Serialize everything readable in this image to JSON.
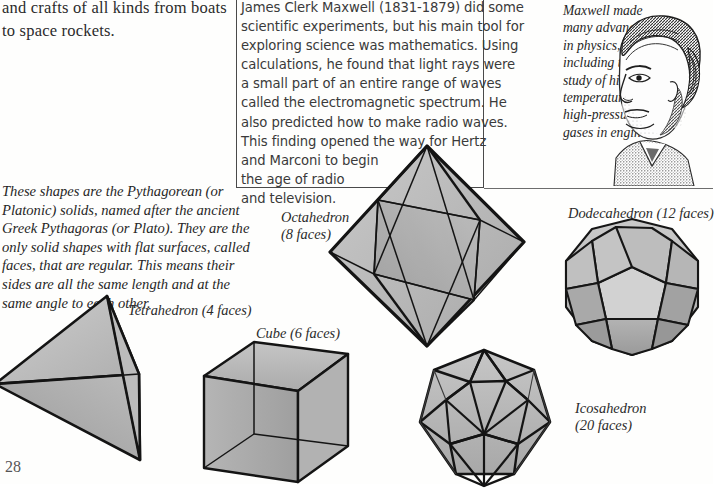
{
  "page": {
    "number": "28",
    "background": "#fefefd",
    "ink": "#2a2a2a"
  },
  "top_left_paragraph": {
    "lines": [
      "and crafts of all kinds from boats",
      "to space rockets."
    ]
  },
  "maxwell_box": {
    "border_color": "#4a4a4a",
    "lines": [
      "James Clerk Maxwell (1831-1879) did some",
      "scientific experiments, but his main tool for",
      "exploring science was mathematics.  Using",
      "calculations, he found that light rays were",
      "a small part of an entire range of waves",
      "called the electromagnetic spectrum.  He",
      "also predicted how to make radio waves.",
      "This finding opened the way for Hertz",
      "and Marconi to begin",
      "the age of radio",
      "and television."
    ]
  },
  "portrait_caption": {
    "lines": [
      "Maxwell made",
      "many advances",
      "in physics,",
      "including the",
      "study of high-",
      "temperature,",
      "high-pressure",
      "gases in engines."
    ]
  },
  "portrait": {
    "alt_name": "maxwell-portrait",
    "style": "stippled engraving"
  },
  "solids_paragraph": {
    "lines": [
      "These shapes are the Pythagorean (or",
      "Platonic) solids, named after the ancient",
      "Greek Pythagoras (or Plato).  They are the",
      "only solid shapes with flat surfaces, called",
      "faces, that are regular.  This means their",
      "sides are all the same length and at the",
      "same angle to each other."
    ]
  },
  "figures": [
    {
      "id": "tetrahedron",
      "label_lines": [
        "Tetrahedron (4 faces)"
      ],
      "faces": 4,
      "fill": "#b6b6b6",
      "stroke": "#1e1e1e"
    },
    {
      "id": "cube",
      "label_lines": [
        "Cube (6 faces)"
      ],
      "faces": 6,
      "fill": "#b0b0b0",
      "stroke": "#1e1e1e"
    },
    {
      "id": "octahedron",
      "label_lines": [
        "Octahedron",
        "(8 faces)"
      ],
      "faces": 8,
      "fill": "#b4b4b4",
      "stroke": "#1e1e1e"
    },
    {
      "id": "dodecahedron",
      "label_lines": [
        "Dodecahedron (12 faces)"
      ],
      "faces": 12,
      "fill": "#b2b2b2",
      "stroke": "#1e1e1e"
    },
    {
      "id": "icosahedron",
      "label_lines": [
        "Icosahedron",
        "(20 faces)"
      ],
      "faces": 20,
      "fill": "#b0b0b0",
      "stroke": "#1e1e1e"
    }
  ],
  "labels": {
    "tetrahedron": "Tetrahedron (4 faces)",
    "cube": "Cube (6 faces)",
    "octahedron_1": "Octahedron",
    "octahedron_2": "(8 faces)",
    "dodecahedron": "Dodecahedron (12 faces)",
    "icosahedron_1": "Icosahedron",
    "icosahedron_2": "(20 faces)"
  }
}
